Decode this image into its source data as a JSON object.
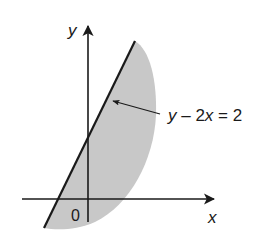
{
  "diagram": {
    "axes": {
      "x_label": "x",
      "y_label": "y",
      "origin_label": "0"
    },
    "line": {
      "equation_label_parts": [
        "y",
        " – 2",
        "x",
        " = 2"
      ],
      "equation": "y − 2x = 2"
    },
    "region": {
      "description": "shaded region to the right of the line y − 2x = 2",
      "fill_color": "#c8c8c8"
    },
    "colors": {
      "ink": "#1a1a1a",
      "shade": "#c8c8c8",
      "background": "#ffffff"
    }
  }
}
